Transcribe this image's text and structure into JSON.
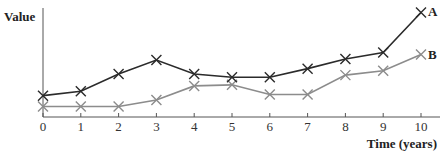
{
  "chart_data": {
    "type": "line",
    "title": "",
    "xlabel": "Time (years)",
    "ylabel": "Value",
    "x": [
      0,
      1,
      2,
      3,
      4,
      5,
      6,
      7,
      8,
      9,
      10
    ],
    "xticks": [
      "0",
      "1",
      "2",
      "3",
      "4",
      "5",
      "6",
      "7",
      "8",
      "9",
      "10"
    ],
    "yticks": [],
    "xlim": [
      0,
      10
    ],
    "ylim": [
      0,
      100
    ],
    "grid": false,
    "legend": "inline labels at line ends",
    "marker": "x",
    "series": [
      {
        "name": "A",
        "color": "#2b2b2b",
        "values": [
          17,
          21,
          37,
          50,
          37,
          34,
          34,
          42,
          51,
          57,
          94
        ]
      },
      {
        "name": "B",
        "color": "#8c8c8c",
        "values": [
          7,
          7,
          7,
          13,
          26,
          27,
          18,
          18,
          36,
          40,
          55
        ]
      }
    ]
  }
}
